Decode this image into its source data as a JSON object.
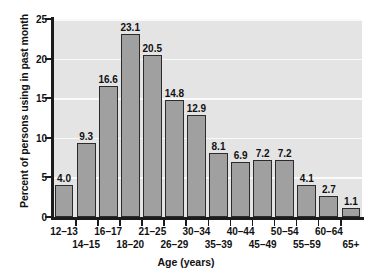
{
  "chart_data": {
    "type": "bar",
    "title": "",
    "xlabel": "Age (years)",
    "ylabel": "Percent of persons using in past month",
    "categories": [
      "12–13",
      "14–15",
      "16–17",
      "18–20",
      "21–25",
      "26–29",
      "30–34",
      "35–39",
      "40–44",
      "45–49",
      "50–54",
      "55–59",
      "60–64",
      "65+"
    ],
    "values": [
      4.0,
      9.3,
      16.6,
      23.1,
      20.5,
      14.8,
      12.9,
      8.1,
      6.9,
      7.2,
      7.2,
      4.1,
      2.7,
      1.1
    ],
    "value_labels": [
      "4.0",
      "9.3",
      "16.6",
      "23.1",
      "20.5",
      "14.8",
      "12.9",
      "8.1",
      "6.9",
      "7.2",
      "7.2",
      "4.1",
      "2.7",
      "1.1"
    ],
    "ylim": [
      0,
      25
    ],
    "yticks": [
      0,
      5,
      10,
      15,
      20,
      25
    ],
    "ytick_labels": [
      "0",
      "5",
      "10",
      "15",
      "20",
      "25"
    ],
    "grid": "horizontal",
    "legend": "none",
    "label_rows": [
      1,
      0,
      1,
      0,
      1,
      0,
      1,
      0,
      1,
      0,
      1,
      0,
      1,
      0
    ],
    "colors": {
      "bar_fill": "#a0a0a0",
      "bar_edge": "#2b2b2b",
      "panel_background": "#e4e4e4",
      "gridline": "#fafafa",
      "axis": "#1b1b1b",
      "text": "#111111",
      "page_background": "#ffffff"
    }
  }
}
